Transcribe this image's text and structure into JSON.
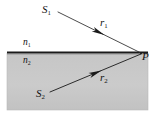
{
  "figure": {
    "caption": "",
    "background_color": "#ffffff",
    "medium_fill_color": "#c8c8c8",
    "line_color": "#111111",
    "boundary": {
      "name": "interface-boundary",
      "x1": 7,
      "y1": 52.5,
      "x2": 148,
      "y2": 52.5,
      "thickness": 2.2
    },
    "medium_box": {
      "x": 7,
      "y": 53,
      "width": 141,
      "height": 57
    },
    "labels": {
      "s1": {
        "text": "S",
        "sub": "1"
      },
      "s2": {
        "text": "S",
        "sub": "2"
      },
      "r1": {
        "text": "r",
        "sub": "1"
      },
      "r2": {
        "text": "r",
        "sub": "2"
      },
      "p": {
        "text": "P",
        "sub": ""
      },
      "n1": {
        "text": "n",
        "sub": "1"
      },
      "n2": {
        "text": "n",
        "sub": "2"
      }
    },
    "rays": [
      {
        "name": "ray-r1",
        "from_label": "S1",
        "to_label": "P",
        "x1": 58,
        "y1": 12,
        "x2": 141,
        "y2": 53,
        "arrow_t": 0.49,
        "direction": "toward-P"
      },
      {
        "name": "ray-r2",
        "from_label": "S2",
        "to_label": "P",
        "x1": 50,
        "y1": 92,
        "x2": 141,
        "y2": 54,
        "arrow_t": 0.5,
        "direction": "toward-P"
      }
    ]
  }
}
